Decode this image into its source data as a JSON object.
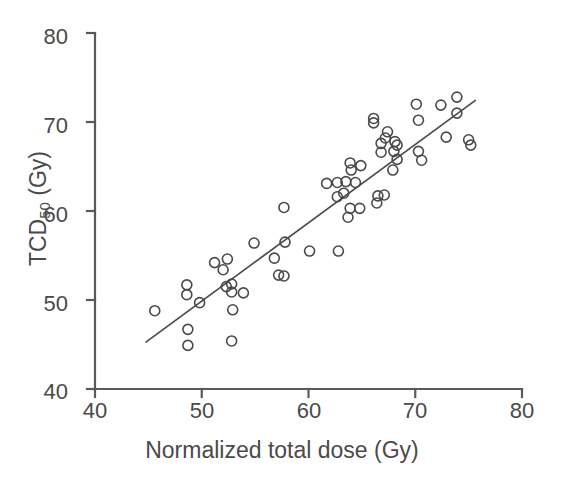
{
  "chart_data": {
    "type": "scatter",
    "title": "",
    "xlabel": "Normalized total dose (Gy)",
    "ylabel_main": "TCD",
    "ylabel_sub": "50",
    "ylabel_unit": " (Gy)",
    "ylabel_full": "TCD50 (Gy)",
    "xlim": [
      40,
      80
    ],
    "ylim": [
      40,
      80
    ],
    "xticks": [
      40,
      50,
      60,
      70,
      80
    ],
    "yticks": [
      40,
      50,
      60,
      70,
      80
    ],
    "xticklabels": [
      "40",
      "50",
      "60",
      "70",
      "80"
    ],
    "yticklabels": [
      "40",
      "50",
      "60",
      "70",
      "80"
    ],
    "grid": false,
    "legend": null,
    "marker": "open-circle",
    "marker_color": "#4a4a4a",
    "marker_radius_px": 5,
    "line_color": "#4a4a4a",
    "axis_color": "#5a5a5a",
    "background": "#ffffff",
    "fit_line": {
      "name": "regression line",
      "x_start": 44.8,
      "y_start": 45.3,
      "x_end": 75.6,
      "y_end": 72.4
    },
    "points": [
      [
        45.6,
        48.8
      ],
      [
        48.6,
        51.7
      ],
      [
        48.6,
        50.6
      ],
      [
        48.7,
        46.7
      ],
      [
        48.7,
        44.9
      ],
      [
        49.8,
        49.7
      ],
      [
        51.2,
        54.2
      ],
      [
        52.0,
        53.4
      ],
      [
        52.4,
        54.6
      ],
      [
        52.3,
        51.5
      ],
      [
        52.8,
        51.8
      ],
      [
        52.8,
        50.9
      ],
      [
        52.9,
        48.9
      ],
      [
        52.8,
        45.4
      ],
      [
        53.9,
        50.8
      ],
      [
        54.9,
        56.4
      ],
      [
        56.8,
        54.7
      ],
      [
        57.2,
        52.8
      ],
      [
        57.7,
        60.4
      ],
      [
        57.7,
        52.7
      ],
      [
        57.8,
        56.5
      ],
      [
        60.1,
        55.5
      ],
      [
        61.7,
        63.1
      ],
      [
        62.7,
        63.2
      ],
      [
        62.7,
        61.6
      ],
      [
        62.8,
        55.5
      ],
      [
        63.3,
        62.0
      ],
      [
        63.5,
        63.3
      ],
      [
        63.7,
        59.3
      ],
      [
        63.9,
        65.4
      ],
      [
        63.9,
        60.3
      ],
      [
        64.0,
        64.6
      ],
      [
        64.4,
        63.2
      ],
      [
        64.8,
        60.3
      ],
      [
        64.9,
        65.1
      ],
      [
        66.1,
        70.4
      ],
      [
        66.1,
        69.9
      ],
      [
        66.4,
        60.9
      ],
      [
        66.5,
        61.7
      ],
      [
        66.8,
        67.6
      ],
      [
        66.8,
        66.6
      ],
      [
        67.1,
        61.8
      ],
      [
        67.2,
        68.2
      ],
      [
        67.4,
        68.9
      ],
      [
        67.9,
        64.6
      ],
      [
        68.0,
        66.7
      ],
      [
        68.1,
        67.8
      ],
      [
        68.3,
        67.4
      ],
      [
        68.3,
        65.8
      ],
      [
        70.1,
        72.0
      ],
      [
        70.3,
        70.2
      ],
      [
        70.3,
        66.7
      ],
      [
        70.6,
        65.7
      ],
      [
        72.4,
        71.9
      ],
      [
        72.9,
        68.3
      ],
      [
        73.9,
        72.8
      ],
      [
        73.9,
        71.0
      ],
      [
        75.0,
        68.0
      ],
      [
        75.2,
        67.4
      ]
    ]
  },
  "axes": {
    "x_tick_labels": [
      "40",
      "50",
      "60",
      "70",
      "80"
    ],
    "y_tick_labels": [
      "40",
      "50",
      "60",
      "70",
      "80"
    ],
    "x_label": "Normalized total dose (Gy)",
    "y_label_main": "TCD",
    "y_label_sub": "50",
    "y_label_tail": " (Gy)"
  }
}
